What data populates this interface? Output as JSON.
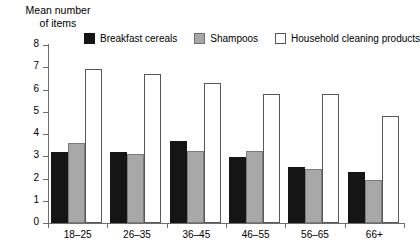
{
  "chart_data": {
    "type": "bar",
    "title": "Mean number\nof items",
    "title_line1": "Mean number",
    "title_line2": "of items",
    "xlabel": "",
    "ylabel": "Mean number of items",
    "ylim": [
      0,
      8
    ],
    "yticks": [
      0,
      1,
      2,
      3,
      4,
      5,
      6,
      7,
      8
    ],
    "ytick_labels": [
      "0",
      "1",
      "2",
      "3",
      "4",
      "5",
      "6",
      "7",
      "8"
    ],
    "grid": false,
    "legend_position": "top",
    "categories": [
      "18–25",
      "26–35",
      "36–45",
      "46–55",
      "56–65",
      "66+"
    ],
    "series": [
      {
        "name": "Breakfast cereals",
        "color": "#151515",
        "values": [
          3.2,
          3.2,
          3.7,
          2.95,
          2.5,
          2.3
        ]
      },
      {
        "name": "Shampoos",
        "color": "#a8a8a8",
        "values": [
          3.6,
          3.1,
          3.25,
          3.25,
          2.45,
          1.95
        ]
      },
      {
        "name": "Household cleaning products",
        "color": "#ffffff",
        "values": [
          6.9,
          6.7,
          6.3,
          5.8,
          5.8,
          4.8
        ]
      }
    ]
  }
}
